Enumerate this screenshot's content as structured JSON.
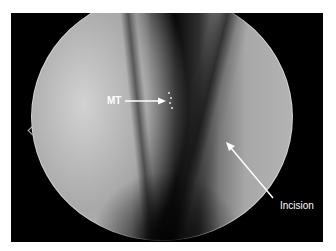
{
  "image": {
    "description": "Circular endoscopic view with dark central cleft and bright side walls",
    "labels": {
      "mt": "MT",
      "incision": "Incision"
    },
    "colors": {
      "background": "#ffffff",
      "frame": "#000000",
      "label": "#ffffff",
      "arrow": "#ffffff"
    }
  }
}
